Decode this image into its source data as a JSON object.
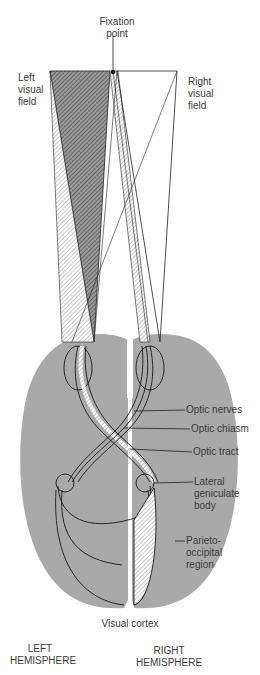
{
  "diagram": {
    "fixation": {
      "line1": "Fixation",
      "line2": "point"
    },
    "left_field": {
      "line1": "Left",
      "line2": "visual",
      "line3": "field"
    },
    "right_field": {
      "line1": "Right",
      "line2": "visual",
      "line3": "field"
    },
    "callouts": {
      "optic_nerves": "Optic nerves",
      "optic_chiasm": "Optic chiasm",
      "optic_tract": "Optic tract",
      "lgb": {
        "line1": "Lateral",
        "line2": "geniculate",
        "line3": "body"
      },
      "parieto": {
        "line1": "Parieto-",
        "line2": "occipital",
        "line3": "region"
      }
    },
    "visual_cortex": "Visual cortex",
    "left_hemisphere": {
      "line1": "LEFT",
      "line2": "HEMISPHERE"
    },
    "right_hemisphere": {
      "line1": "RIGHT",
      "line2": "HEMISPHERE"
    },
    "colors": {
      "brain": "#a9a9a9",
      "line": "#1a1a1a",
      "hatch": "#555555"
    }
  }
}
